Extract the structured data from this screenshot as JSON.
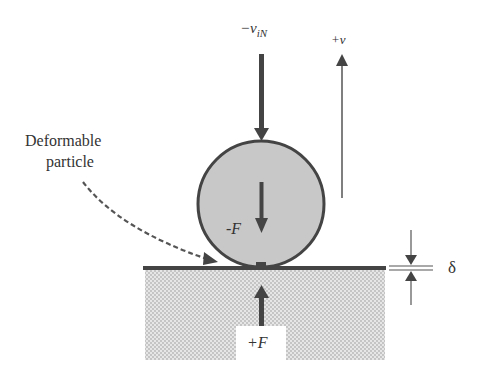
{
  "diagram": {
    "labels": {
      "initial_velocity": "−v",
      "initial_velocity_sub": "iN",
      "rebound_velocity": "+v",
      "particle_name_line1": "Deformable",
      "particle_name_line2": "particle",
      "force_on_particle": "-F",
      "reaction_force": "+F",
      "deformation": "δ"
    },
    "colors": {
      "particle_fill": "#c8c8c8",
      "stroke": "#444444",
      "ground_hatch": "#cfcfcf"
    }
  }
}
